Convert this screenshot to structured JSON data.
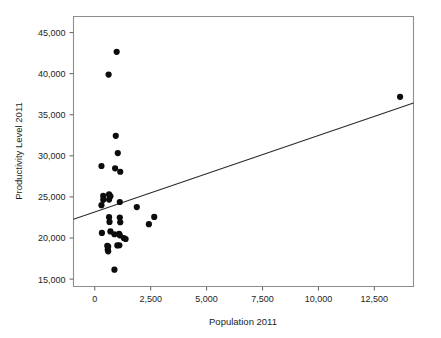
{
  "chart_data": {
    "type": "scatter",
    "title": "",
    "xlabel": "Population 2011",
    "ylabel": "Productivity Level 2011",
    "xlim": [
      -950,
      14250
    ],
    "ylim": [
      14100,
      46950
    ],
    "xticks": [
      0,
      2500,
      5000,
      7500,
      10000,
      12500
    ],
    "xticklabels": [
      "0",
      "2,500",
      "5,000",
      "7,500",
      "10,000",
      "12,500"
    ],
    "yticks": [
      15000,
      20000,
      25000,
      30000,
      35000,
      40000,
      45000
    ],
    "yticklabels": [
      "15,000",
      "20,000",
      "25,000",
      "30,000",
      "35,000",
      "40,000",
      "45,000"
    ],
    "grid": false,
    "legend": null,
    "marker": {
      "shape": "circle",
      "color": "#0c0c0c",
      "size": 3.1
    },
    "points": [
      {
        "x": 980,
        "y": 42650
      },
      {
        "x": 620,
        "y": 39880
      },
      {
        "x": 940,
        "y": 32430
      },
      {
        "x": 1030,
        "y": 30330
      },
      {
        "x": 300,
        "y": 28760
      },
      {
        "x": 910,
        "y": 28480
      },
      {
        "x": 1140,
        "y": 28060
      },
      {
        "x": 380,
        "y": 25120
      },
      {
        "x": 640,
        "y": 25300
      },
      {
        "x": 700,
        "y": 25080
      },
      {
        "x": 380,
        "y": 24650
      },
      {
        "x": 640,
        "y": 24680
      },
      {
        "x": 300,
        "y": 23990
      },
      {
        "x": 1120,
        "y": 24380
      },
      {
        "x": 1880,
        "y": 23760
      },
      {
        "x": 640,
        "y": 22530
      },
      {
        "x": 1120,
        "y": 22480
      },
      {
        "x": 660,
        "y": 21960
      },
      {
        "x": 1140,
        "y": 21920
      },
      {
        "x": 2420,
        "y": 21680
      },
      {
        "x": 2660,
        "y": 22560
      },
      {
        "x": 320,
        "y": 20620
      },
      {
        "x": 700,
        "y": 20800
      },
      {
        "x": 880,
        "y": 20460
      },
      {
        "x": 1090,
        "y": 20520
      },
      {
        "x": 1120,
        "y": 20330
      },
      {
        "x": 1300,
        "y": 20000
      },
      {
        "x": 1380,
        "y": 19880
      },
      {
        "x": 560,
        "y": 19060
      },
      {
        "x": 600,
        "y": 18960
      },
      {
        "x": 580,
        "y": 18560
      },
      {
        "x": 600,
        "y": 18380
      },
      {
        "x": 1010,
        "y": 19100
      },
      {
        "x": 1100,
        "y": 19120
      },
      {
        "x": 880,
        "y": 16150
      },
      {
        "x": 13650,
        "y": 37180
      }
    ],
    "fit_line": {
      "label": "linear fit",
      "x_start": -950,
      "y_start": 22280,
      "x_end": 14250,
      "y_end": 36420
    }
  },
  "colors": {
    "marker": "#0c0c0c",
    "fit_line": "#2a2a2a",
    "frame": "#8d8d8d",
    "text": "#1d1d1d",
    "background": "#ffffff"
  }
}
